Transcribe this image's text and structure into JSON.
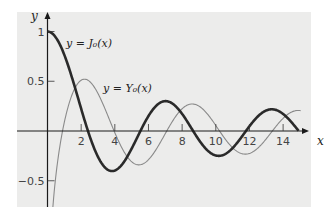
{
  "chart_data": {
    "type": "line",
    "title": "",
    "xlabel": "x",
    "ylabel": "y",
    "xlim": [
      0,
      15.2
    ],
    "ylim": [
      -0.75,
      1.18
    ],
    "grid": false,
    "legend": "none (inline curve labels)",
    "x_ticks": [
      2,
      4,
      6,
      8,
      10,
      12,
      14
    ],
    "x_tick_labels": [
      "2",
      "4",
      "6",
      "8",
      "10",
      "12",
      "14"
    ],
    "y_ticks": [
      1,
      0.5,
      -0.5
    ],
    "y_tick_labels": [
      "1",
      "0.5",
      "−0.5"
    ],
    "series": [
      {
        "name": "J0",
        "label": "y = J₀(x)",
        "style": "thick dark",
        "color": "#2a2a2a",
        "x": [
          0,
          1,
          2,
          2.405,
          3,
          3.832,
          4,
          5,
          5.52,
          6,
          7,
          7.016,
          8,
          8.654,
          9,
          10,
          10.17,
          11,
          11.79,
          12,
          13,
          13.32,
          14,
          14.93
        ],
        "y": [
          1,
          0.765,
          0.224,
          0,
          -0.26,
          -0.403,
          -0.397,
          -0.178,
          0,
          0.151,
          0.3,
          0.3,
          0.172,
          0,
          -0.09,
          -0.246,
          -0.25,
          -0.171,
          0,
          0.048,
          0.207,
          0.218,
          0.171,
          0
        ]
      },
      {
        "name": "Y0",
        "label": "y = Y₀(x)",
        "style": "thin gray",
        "color": "#8a8a8a",
        "x": [
          0.2,
          0.5,
          0.894,
          1,
          2,
          2.197,
          3,
          3.958,
          4,
          5,
          5.43,
          6,
          7,
          7.086,
          8,
          8.6,
          9,
          10,
          10.22,
          11,
          11.75,
          12,
          13,
          13.36,
          14,
          15
        ],
        "y": [
          -1.08,
          -0.445,
          0,
          0.088,
          0.51,
          0.521,
          0.377,
          0,
          -0.017,
          -0.309,
          -0.34,
          -0.288,
          -0.026,
          0,
          0.223,
          0.273,
          0.25,
          0.056,
          0,
          -0.169,
          -0.25,
          -0.225,
          -0.078,
          0,
          0.127,
          0.206
        ]
      }
    ]
  },
  "labels": {
    "x_axis": "x",
    "y_axis": "y",
    "j0": "y = J₀(x)",
    "y0": "y = Y₀(x)"
  }
}
